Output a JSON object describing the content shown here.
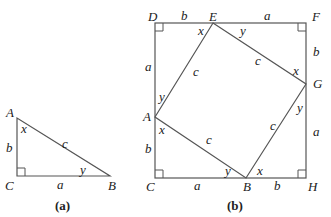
{
  "figure_a": {
    "caption": "(a)",
    "vertices": {
      "A": "A",
      "B": "B",
      "C": "C"
    },
    "sides": {
      "a": "a",
      "b": "b",
      "c": "c"
    },
    "angles": {
      "x": "x",
      "y": "y"
    }
  },
  "figure_b": {
    "caption": "(b)",
    "vertices": {
      "A": "A",
      "B": "B",
      "C": "C",
      "D": "D",
      "E": "E",
      "F": "F",
      "G": "G",
      "H": "H"
    },
    "labels": {
      "DE": "b",
      "EF": "a",
      "FG": "b",
      "GH": "a",
      "BH": "b",
      "CB": "a",
      "CA": "b",
      "AD": "a",
      "AE": "c",
      "EG": "c",
      "GB": "c",
      "BA": "c",
      "angle_E_x": "x",
      "angle_E_y": "y",
      "angle_G_x": "x",
      "angle_G_y": "y",
      "angle_B_x": "x",
      "angle_B_y": "y",
      "angle_A_x": "x",
      "angle_A_y": "y"
    }
  },
  "colors": {
    "stroke": "#555555",
    "text": "#222222",
    "background": "#ffffff"
  }
}
